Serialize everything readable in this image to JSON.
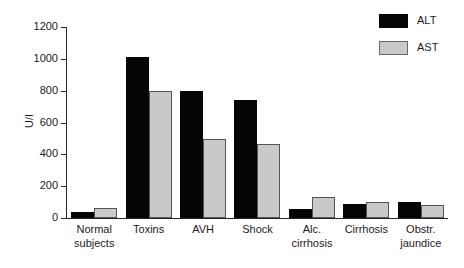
{
  "chart_data": {
    "type": "bar",
    "title": "",
    "xlabel": "",
    "ylabel": "U/l",
    "ylim": [
      0,
      1200
    ],
    "yticks": [
      1200,
      1000,
      800,
      600,
      400,
      200,
      0
    ],
    "ytick_labels": [
      "1200",
      "1000",
      "800",
      "600",
      "400",
      "200",
      "0"
    ],
    "grid": false,
    "legend_position": "top-right",
    "categories": [
      "Normal subjects",
      "Toxins",
      "AVH",
      "Shock",
      "Alc. cirrhosis",
      "Cirrhosis",
      "Obstr. jaundice"
    ],
    "category_lines": [
      [
        "Normal",
        "subjects"
      ],
      [
        "Toxins"
      ],
      [
        "AVH"
      ],
      [
        "Shock"
      ],
      [
        "Alc.",
        "cirrhosis"
      ],
      [
        "Cirrhosis"
      ],
      [
        "Obstr.",
        "jaundice"
      ]
    ],
    "series": [
      {
        "name": "ALT",
        "color": "#050505",
        "values": [
          40,
          1010,
          795,
          740,
          55,
          85,
          100
        ]
      },
      {
        "name": "AST",
        "color": "#c9c9c9",
        "values": [
          65,
          800,
          495,
          465,
          130,
          100,
          80
        ]
      }
    ]
  },
  "legend": {
    "items": [
      {
        "label": "ALT",
        "swatch": "alt"
      },
      {
        "label": "AST",
        "swatch": "ast"
      }
    ]
  }
}
